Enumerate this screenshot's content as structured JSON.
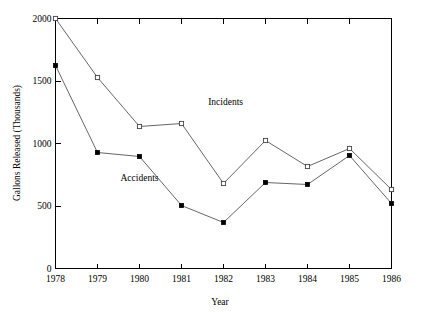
{
  "chart_data": {
    "type": "line",
    "title": "",
    "xlabel": "Year",
    "ylabel": "Gallons Released (Thousands)",
    "categories": [
      1978,
      1979,
      1980,
      1981,
      1982,
      1983,
      1984,
      1985,
      1986
    ],
    "x_tick_labels": [
      "1978",
      "1979",
      "1980",
      "1981",
      "1982",
      "1983",
      "1984",
      "1985",
      "1986"
    ],
    "y_tick_labels": [
      "0",
      "500",
      "1000",
      "1500",
      "2000"
    ],
    "y_ticks": [
      0,
      500,
      1000,
      1500,
      2000
    ],
    "xlim": [
      1978,
      1986
    ],
    "ylim": [
      0,
      2000
    ],
    "grid": false,
    "legend_position": "inline-annotation",
    "series": [
      {
        "name": "Incidents",
        "marker": "open-square",
        "marker_color": "#ffffff",
        "line_color": "#555555",
        "values": [
          2000,
          1528,
          1136,
          1160,
          680,
          1024,
          816,
          960,
          632
        ],
        "annotation": {
          "label": "Incidents",
          "x": 1982.05,
          "y": 1310
        }
      },
      {
        "name": "Accidents",
        "marker": "filled-square",
        "marker_color": "#000000",
        "line_color": "#555555",
        "values": [
          1624,
          928,
          896,
          504,
          368,
          688,
          672,
          904,
          520
        ],
        "annotation": {
          "label": "Accidents",
          "x": 1980.0,
          "y": 700
        }
      }
    ]
  },
  "colors": {
    "axis": "#000000",
    "line": "#555555",
    "filled_marker": "#000000",
    "open_marker": "#ffffff",
    "background": "#ffffff"
  }
}
